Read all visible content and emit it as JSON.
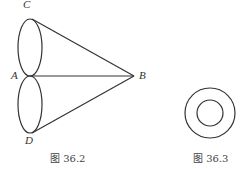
{
  "figures": [
    {
      "caption": "图 36.2",
      "points": {
        "A": "A",
        "B": "B",
        "C": "C",
        "D": "D"
      }
    },
    {
      "caption": "图 36.3"
    }
  ],
  "colors": {
    "stroke": "#333333"
  }
}
